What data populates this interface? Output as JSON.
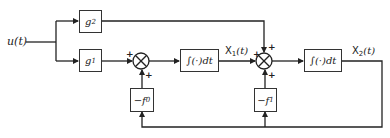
{
  "diagram": {
    "type": "block-diagram",
    "input": {
      "label": "u(t)"
    },
    "blocks": {
      "g2": {
        "label": "g",
        "sub": "2"
      },
      "g1": {
        "label": "g",
        "sub": "1"
      },
      "int1": {
        "label": "∫(·)dt"
      },
      "int2": {
        "label": "∫(·)dt"
      },
      "f0": {
        "label": "−f",
        "sub": "0"
      },
      "f1": {
        "label": "−f",
        "sub": "1"
      }
    },
    "signals": {
      "x1": {
        "label": "X",
        "sub": "1",
        "suffix": "(t)"
      },
      "x2": {
        "label": "X",
        "sub": "2",
        "suffix": "(t)"
      }
    },
    "summing_junctions": [
      {
        "id": "sum1",
        "signs": [
          "+",
          "+"
        ]
      },
      {
        "id": "sum2",
        "signs": [
          "+",
          "+",
          "+"
        ]
      }
    ],
    "connections": [
      "u(t) -> g2",
      "u(t) -> g1",
      "g1 -> sum1 (+)",
      "-f0 -> sum1 (+)",
      "sum1 -> int1",
      "int1 -> X1(t) -> sum2 (+)",
      "g2 -> sum2 (+)",
      "-f1 -> sum2 (+)",
      "sum2 -> int2",
      "int2 -> X2(t)",
      "X2(t) -> -f0",
      "X2(t) -> -f1"
    ]
  }
}
